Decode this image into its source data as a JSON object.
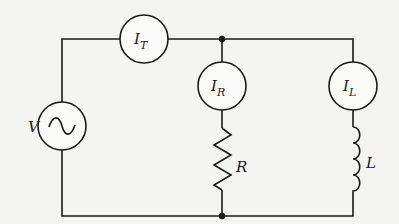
{
  "diagram": {
    "type": "circuit",
    "source": {
      "label": "V",
      "symbol": "ac-sine"
    },
    "meters": [
      {
        "id": "total",
        "label": "I",
        "subscript": "T"
      },
      {
        "id": "resistor-branch",
        "label": "I",
        "subscript": "R"
      },
      {
        "id": "inductor-branch",
        "label": "I",
        "subscript": "L"
      }
    ],
    "components": [
      {
        "id": "resistor",
        "label": "R"
      },
      {
        "id": "inductor",
        "label": "L"
      }
    ],
    "colors": {
      "line": "#1a1a1a",
      "background": "#f4f4f2"
    }
  }
}
